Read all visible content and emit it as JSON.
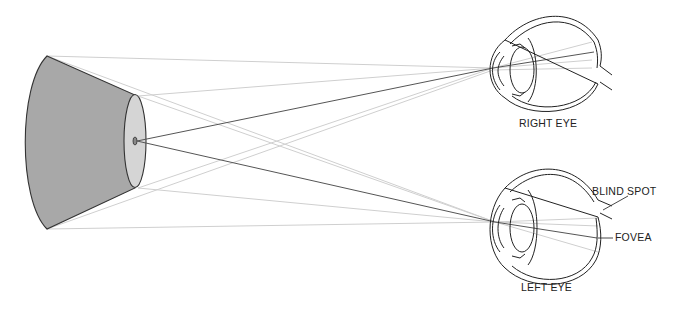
{
  "diagram": {
    "type": "binocular-vision-optics",
    "labels": {
      "right_eye": "RIGHT EYE",
      "left_eye": "LEFT EYE",
      "blind_spot": "BLIND SPOT",
      "fovea": "FOVEA"
    },
    "colors": {
      "cone_fill": "#a9a9a9",
      "cone_face_fill": "#d4d4d4",
      "outline": "#333333",
      "light_ray": "#c8c8c8",
      "focus_ray": "#555555",
      "background": "#ffffff"
    },
    "object": {
      "shape": "truncated-cone",
      "focus_point": [
        135,
        141
      ]
    },
    "eyes": [
      {
        "name": "right-eye",
        "center": [
          545,
          70
        ]
      },
      {
        "name": "left-eye",
        "center": [
          545,
          237
        ]
      }
    ]
  }
}
